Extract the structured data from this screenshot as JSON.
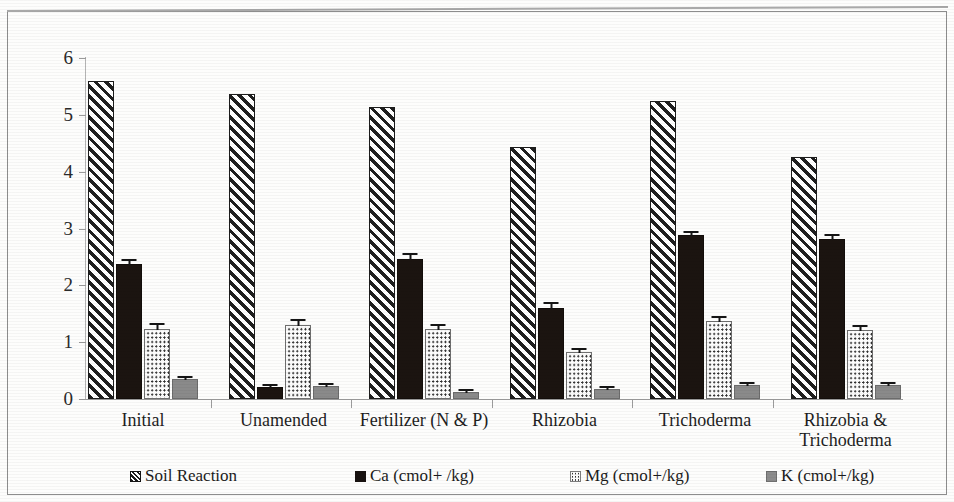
{
  "chart_data": {
    "type": "bar",
    "title": "",
    "xlabel": "",
    "ylabel": "",
    "ylim": [
      0,
      6
    ],
    "ytick_labels": [
      "0",
      "1",
      "2",
      "3",
      "4",
      "5",
      "6"
    ],
    "yticks": [
      0,
      1,
      2,
      3,
      4,
      5,
      6
    ],
    "grid": false,
    "legend_position": "bottom",
    "error_bars": true,
    "categories": [
      "Initial",
      "Unamended",
      "Fertilizer (N & P)",
      "Rhizobia",
      "Trichoderma",
      "Rhizobia & Trichoderma"
    ],
    "series": [
      {
        "name": "Soil Reaction",
        "pattern": "diagonal-hatch",
        "color": "#1f1f1f",
        "values": [
          5.6,
          5.37,
          5.14,
          4.43,
          5.24,
          4.26
        ],
        "errors": [
          0.0,
          0.0,
          0.0,
          0.0,
          0.0,
          0.0
        ]
      },
      {
        "name": "Ca (cmol+ /kg)",
        "pattern": "solid-dark",
        "color": "#1b1410",
        "values": [
          2.38,
          0.22,
          2.47,
          1.6,
          2.88,
          2.82
        ],
        "errors": [
          0.11,
          0.04,
          0.11,
          0.12,
          0.09,
          0.1
        ]
      },
      {
        "name": "Mg (cmol+/kg)",
        "pattern": "dotted",
        "color": "#2e2e2e",
        "values": [
          1.23,
          1.3,
          1.24,
          0.83,
          1.38,
          1.22
        ],
        "errors": [
          0.12,
          0.12,
          0.09,
          0.09,
          0.1,
          0.1
        ]
      },
      {
        "name": "K (cmol+/kg)",
        "pattern": "solid-gray",
        "color": "#8a8a8a",
        "values": [
          0.36,
          0.23,
          0.13,
          0.18,
          0.25,
          0.24
        ],
        "errors": [
          0.04,
          0.03,
          0.02,
          0.03,
          0.03,
          0.03
        ]
      }
    ]
  },
  "legend": {
    "items": [
      {
        "label": "Soil Reaction",
        "swatch": "diag"
      },
      {
        "label": "Ca (cmol+ /kg)",
        "swatch": "solid-dark"
      },
      {
        "label": "Mg (cmol+/kg)",
        "swatch": "dots"
      },
      {
        "label": "K (cmol+/kg)",
        "swatch": "gray"
      }
    ]
  },
  "axis": {
    "y_labels": [
      "6",
      "5",
      "4",
      "3",
      "2",
      "1",
      "0"
    ]
  }
}
